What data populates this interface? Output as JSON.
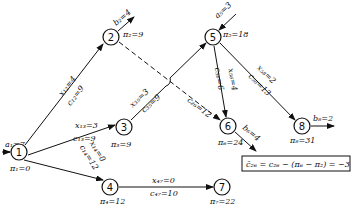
{
  "diagram": {
    "type": "network-flow",
    "nodes": [
      {
        "id": "1",
        "label": "1",
        "potential": "π₁=0",
        "supply": "a₁=7"
      },
      {
        "id": "2",
        "label": "2",
        "potential": "π₂=9",
        "demand": "b₂=4"
      },
      {
        "id": "3",
        "label": "3",
        "potential": "π₃=9"
      },
      {
        "id": "4",
        "label": "4",
        "potential": "π₄=12"
      },
      {
        "id": "5",
        "label": "5",
        "potential": "π₅=18",
        "supply": "a₅=3"
      },
      {
        "id": "6",
        "label": "6",
        "potential": "π₆=24",
        "demand": "b₆=4"
      },
      {
        "id": "7",
        "label": "7",
        "potential": "π₇=22"
      },
      {
        "id": "8",
        "label": "8",
        "potential": "π₈=31",
        "demand": "b₈=2"
      }
    ],
    "edges": [
      {
        "from": "1",
        "to": "2",
        "flow": "x₁₂=4",
        "cost": "c₁₂=9",
        "style": "solid"
      },
      {
        "from": "1",
        "to": "3",
        "flow": "x₁₃=3",
        "cost": "c₁₃=9",
        "style": "solid"
      },
      {
        "from": "1",
        "to": "4",
        "flow": "x₁₄=0",
        "cost": "c₁₄=12",
        "style": "solid"
      },
      {
        "from": "3",
        "to": "5",
        "flow": "x₃₅=3",
        "cost": "c₃₅=9",
        "style": "solid"
      },
      {
        "from": "2",
        "to": "6",
        "cost": "c₂₆=12",
        "style": "dashed"
      },
      {
        "from": "5",
        "to": "6",
        "flow": "x₅₆=4",
        "cost": "c₅₆=6",
        "style": "solid"
      },
      {
        "from": "5",
        "to": "8",
        "flow": "x₅₈=2",
        "cost": "c₅₈=13",
        "style": "solid"
      },
      {
        "from": "4",
        "to": "7",
        "flow": "x₄₇=0",
        "cost": "c₄₇=10",
        "style": "solid"
      }
    ],
    "annotation": "c̄₂₆ = c₂₆ − (π₆ − π₂) = −3"
  }
}
